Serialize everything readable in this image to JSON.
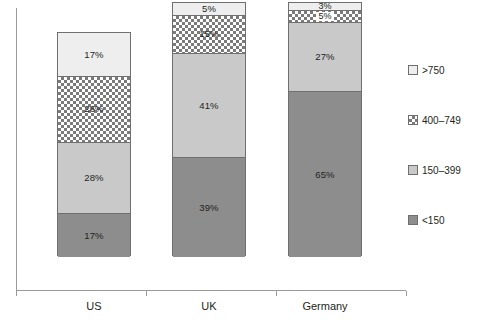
{
  "chart_data": {
    "type": "bar",
    "subtype": "stacked-100-percent",
    "title": "",
    "xlabel": "",
    "ylabel": "",
    "ylim": [
      0,
      100
    ],
    "grid": false,
    "legend_position": "right",
    "categories": [
      "US",
      "UK",
      "Germany"
    ],
    "series": [
      {
        "name": "<150",
        "values": [
          17,
          39,
          65
        ]
      },
      {
        "name": "150-399",
        "values": [
          28,
          41,
          27
        ]
      },
      {
        "name": "400-749",
        "values": [
          26,
          15,
          5
        ]
      },
      {
        "name": ">750",
        "values": [
          17,
          5,
          3
        ]
      }
    ],
    "value_labels": {
      "US": [
        "17%",
        "28%",
        "26%",
        "17%"
      ],
      "UK": [
        "39%",
        "41%",
        "15%",
        "5%"
      ],
      "Germany": [
        "65%",
        "27%",
        "5%",
        "3%"
      ]
    },
    "colors": {
      "lt150": "#8d8d8d",
      "150-399": "#c9c9c9",
      "400-749": "#ffffff",
      "gt750": "#eeeeee",
      "outline": "#6f6f6f",
      "axis": "#9a9a9a",
      "text": "#231f20"
    }
  },
  "axis": {
    "x_tick_labels": [
      "US",
      "UK",
      "Germany"
    ]
  },
  "legend": {
    "items": [
      {
        "label": ">750",
        "swatch": "legend-swatch-gt750"
      },
      {
        "label": "400–749",
        "swatch": "legend-swatch-400-749"
      },
      {
        "label": "150–399",
        "swatch": "legend-swatch-150-399"
      },
      {
        "label": "<150",
        "swatch": "legend-swatch-lt150"
      }
    ]
  },
  "bars": {
    "us": {
      "category": "US",
      "segments": [
        {
          "series": ">750",
          "value": 17,
          "label": "17%"
        },
        {
          "series": "400-749",
          "value": 26,
          "label": "26%"
        },
        {
          "series": "150-399",
          "value": 28,
          "label": "28%"
        },
        {
          "series": "<150",
          "value": 17,
          "label": "17%"
        }
      ]
    },
    "uk": {
      "category": "UK",
      "segments": [
        {
          "series": ">750",
          "value": 5,
          "label": "5%"
        },
        {
          "series": "400-749",
          "value": 15,
          "label": "15%"
        },
        {
          "series": "150-399",
          "value": 41,
          "label": "41%"
        },
        {
          "series": "<150",
          "value": 39,
          "label": "39%"
        }
      ]
    },
    "germany": {
      "category": "Germany",
      "segments": [
        {
          "series": ">750",
          "value": 3,
          "label": "3%"
        },
        {
          "series": "400-749",
          "value": 5,
          "label": "5%"
        },
        {
          "series": "150-399",
          "value": 27,
          "label": "27%"
        },
        {
          "series": "<150",
          "value": 65,
          "label": "65%"
        }
      ]
    }
  }
}
